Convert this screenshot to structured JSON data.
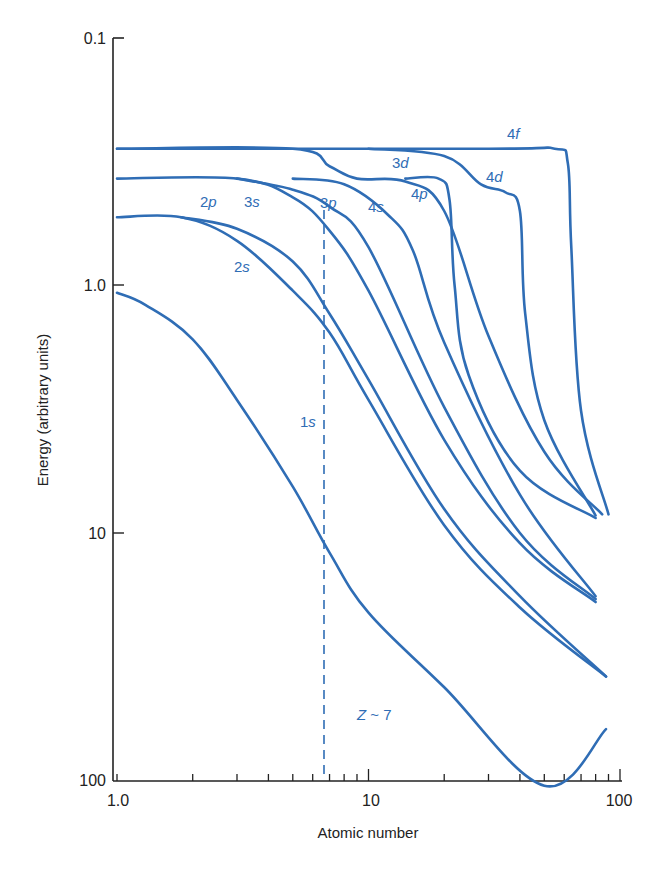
{
  "chart_data": {
    "type": "line",
    "title": "",
    "xlabel": "Atomic number",
    "ylabel": "Energy (arbitrary units)",
    "x_scale": "log",
    "y_scale": "log",
    "y_inverted": true,
    "xlim": [
      1,
      100
    ],
    "ylim": [
      0.1,
      100
    ],
    "x_ticks": [
      "1.0",
      "10",
      "100"
    ],
    "y_ticks": [
      "0.1",
      "1.0",
      "10",
      "100"
    ],
    "grid": false,
    "legend": null,
    "line_color": "#2f6db5",
    "annotations": [
      {
        "text": "Z ~ 7",
        "x": 8.9,
        "y": 70
      },
      {
        "type": "vertical-dashed-line",
        "x": 7
      }
    ],
    "series": [
      {
        "name": "1s",
        "points": [
          [
            1.0,
            1.07
          ],
          [
            1.3,
            1.2
          ],
          [
            2.0,
            1.65
          ],
          [
            3.0,
            2.9
          ],
          [
            5.0,
            6.5
          ],
          [
            7.0,
            12
          ],
          [
            10,
            21
          ],
          [
            20,
            42
          ],
          [
            50,
            105
          ],
          [
            88,
            62
          ]
        ]
      },
      {
        "name": "2s",
        "points": [
          [
            1.0,
            0.53
          ],
          [
            1.8,
            0.53
          ],
          [
            3.0,
            0.66
          ],
          [
            5.0,
            1.05
          ],
          [
            7.0,
            1.55
          ],
          [
            10,
            2.9
          ],
          [
            20,
            9.3
          ],
          [
            40,
            20
          ],
          [
            88,
            38
          ]
        ]
      },
      {
        "name": "2p",
        "points": [
          [
            1.8,
            0.53
          ],
          [
            3.0,
            0.59
          ],
          [
            5.0,
            0.8
          ],
          [
            7.0,
            1.3
          ],
          [
            10,
            2.4
          ],
          [
            20,
            8
          ],
          [
            40,
            18
          ],
          [
            88,
            38
          ]
        ]
      },
      {
        "name": "3s",
        "points": [
          [
            1.0,
            0.37
          ],
          [
            3.0,
            0.37
          ],
          [
            5.0,
            0.44
          ],
          [
            7.0,
            0.6
          ],
          [
            10,
            1.05
          ],
          [
            20,
            4.2
          ],
          [
            40,
            11
          ],
          [
            80,
            19
          ]
        ]
      },
      {
        "name": "3p",
        "points": [
          [
            3.0,
            0.37
          ],
          [
            5.0,
            0.41
          ],
          [
            7.0,
            0.48
          ],
          [
            10,
            0.7
          ],
          [
            20,
            3.1
          ],
          [
            40,
            10
          ],
          [
            80,
            18.5
          ]
        ]
      },
      {
        "name": "4s",
        "points": [
          [
            5.0,
            0.37
          ],
          [
            8.0,
            0.39
          ],
          [
            12,
            0.52
          ],
          [
            15,
            0.72
          ],
          [
            20,
            1.7
          ],
          [
            40,
            7
          ],
          [
            80,
            18
          ]
        ]
      },
      {
        "name": "3d",
        "points": [
          [
            1.0,
            0.28
          ],
          [
            5.0,
            0.28
          ],
          [
            7.0,
            0.33
          ],
          [
            9.0,
            0.37
          ],
          [
            14,
            0.38
          ],
          [
            20,
            0.5
          ],
          [
            30,
            1.6
          ],
          [
            50,
            4.7
          ],
          [
            85,
            8.4
          ]
        ]
      },
      {
        "name": "4p",
        "points": [
          [
            14,
            0.37
          ],
          [
            19,
            0.37
          ],
          [
            21,
            0.45
          ],
          [
            22,
            1.0
          ],
          [
            25,
            2.3
          ],
          [
            40,
            5.6
          ],
          [
            80,
            8.7
          ]
        ]
      },
      {
        "name": "4d",
        "points": [
          [
            10,
            0.28
          ],
          [
            20,
            0.3
          ],
          [
            28,
            0.39
          ],
          [
            35,
            0.42
          ],
          [
            40,
            0.5
          ],
          [
            42,
            1.3
          ],
          [
            50,
            3.5
          ],
          [
            80,
            8.5
          ]
        ]
      },
      {
        "name": "4f",
        "points": [
          [
            1.0,
            0.28
          ],
          [
            30,
            0.28
          ],
          [
            55,
            0.28
          ],
          [
            62,
            0.32
          ],
          [
            64,
            0.7
          ],
          [
            70,
            3.2
          ],
          [
            90,
            8.4
          ]
        ]
      }
    ],
    "label_positions": [
      {
        "name": "1s",
        "px": [
          300,
          427
        ]
      },
      {
        "name": "2s",
        "px": [
          234,
          272
        ]
      },
      {
        "name": "2p",
        "px": [
          200,
          207
        ]
      },
      {
        "name": "3s",
        "px": [
          244,
          207
        ]
      },
      {
        "name": "3p",
        "px": [
          320,
          208
        ]
      },
      {
        "name": "4s",
        "px": [
          368,
          212
        ]
      },
      {
        "name": "3d",
        "px": [
          392,
          168
        ]
      },
      {
        "name": "4p",
        "px": [
          411,
          199
        ]
      },
      {
        "name": "4d",
        "px": [
          486,
          182
        ]
      },
      {
        "name": "4f",
        "px": [
          507,
          139
        ]
      }
    ]
  }
}
